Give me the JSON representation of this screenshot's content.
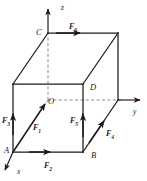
{
  "figure": {
    "shape": "cube",
    "line_color": "#1a1a1a",
    "dash_color": "#8a8a8a",
    "background": "#ffffff"
  },
  "axes": [
    {
      "name": "z",
      "label": "z",
      "direction": "up",
      "x": 61,
      "y": 4
    },
    {
      "name": "y",
      "label": "y",
      "direction": "right",
      "x": 133,
      "y": 108
    },
    {
      "name": "x",
      "label": "x",
      "direction": "down-left",
      "x": 17,
      "y": 168
    }
  ],
  "vertices": [
    {
      "name": "C",
      "label": "C",
      "x": 36,
      "y": 28
    },
    {
      "name": "D",
      "label": "D",
      "x": 90,
      "y": 83
    },
    {
      "name": "O",
      "label": "O",
      "x": 48,
      "y": 97
    },
    {
      "name": "A",
      "label": "A",
      "x": 4,
      "y": 146
    },
    {
      "name": "B",
      "label": "B",
      "x": 91,
      "y": 151
    }
  ],
  "forces": [
    {
      "name": "F1",
      "label": "F",
      "sub": "1",
      "x": 33,
      "y": 124,
      "direction": "up-right along diagonal A to O"
    },
    {
      "name": "F2",
      "label": "F",
      "sub": "2",
      "x": 44,
      "y": 162,
      "direction": "right along bottom front edge A to B"
    },
    {
      "name": "F3",
      "label": "F",
      "sub": "3",
      "x": 2,
      "y": 117,
      "direction": "up along left front vertical edge"
    },
    {
      "name": "F4",
      "label": "F",
      "sub": "4",
      "x": 106,
      "y": 130,
      "direction": "up-right along bottom right diagonal edge"
    },
    {
      "name": "F5",
      "label": "F",
      "sub": "5",
      "x": 70,
      "y": 117,
      "direction": "up along right front vertical edge"
    },
    {
      "name": "F6",
      "label": "F",
      "sub": "6",
      "x": 69,
      "y": 23,
      "direction": "right along top back edge from C"
    }
  ]
}
